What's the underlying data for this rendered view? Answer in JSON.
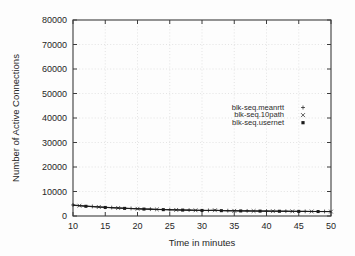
{
  "chart_data": {
    "type": "line",
    "title": "",
    "xlabel": "Time in minutes",
    "ylabel": "Number of Active Connections",
    "xlim": [
      10,
      50
    ],
    "ylim": [
      0,
      80000
    ],
    "grid": true,
    "legend_position": "center-right",
    "xticks": [
      "10",
      "15",
      "20",
      "25",
      "30",
      "35",
      "40",
      "45",
      "50"
    ],
    "xtick_values": [
      10,
      15,
      20,
      25,
      30,
      35,
      40,
      45,
      50
    ],
    "yticks": [
      "0",
      "10000",
      "20000",
      "30000",
      "40000",
      "50000",
      "60000",
      "70000",
      "80000"
    ],
    "ytick_values": [
      0,
      10000,
      20000,
      30000,
      40000,
      50000,
      60000,
      70000,
      80000
    ],
    "x": [
      10,
      11,
      12,
      13,
      14,
      15,
      16,
      17,
      18,
      19,
      20,
      21,
      22,
      23,
      24,
      25,
      26,
      27,
      28,
      29,
      30,
      31,
      32,
      33,
      34,
      35,
      36,
      37,
      38,
      39,
      40,
      41,
      42,
      43,
      44,
      45,
      46,
      47,
      48,
      49,
      50
    ],
    "series": [
      {
        "name": "blk-seq.meanrtt",
        "marker": "plus",
        "marker_glyph": "+",
        "values": [
          4500,
          4280,
          4080,
          3900,
          3740,
          3580,
          3440,
          3310,
          3190,
          3080,
          2980,
          2880,
          2800,
          2720,
          2650,
          2580,
          2520,
          2460,
          2410,
          2360,
          2320,
          2280,
          2400,
          2220,
          2180,
          2150,
          2120,
          2090,
          2060,
          2040,
          2010,
          1990,
          1970,
          1950,
          1930,
          1910,
          1890,
          1870,
          1850,
          1840,
          1820
        ]
      },
      {
        "name": "blk-seq.10path",
        "marker": "cross",
        "marker_glyph": "×",
        "values": [
          4420,
          4210,
          4010,
          3840,
          3680,
          3530,
          3390,
          3270,
          3150,
          3040,
          2940,
          2850,
          2770,
          2690,
          2620,
          2550,
          2490,
          2430,
          2380,
          2330,
          2290,
          2250,
          2340,
          2190,
          2150,
          2120,
          2090,
          2060,
          2030,
          2010,
          1985,
          1965,
          1945,
          1925,
          1905,
          1885,
          1865,
          1850,
          1830,
          1815,
          1800
        ]
      },
      {
        "name": "blk-seq.usernet",
        "marker": "square",
        "marker_glyph": "▪",
        "values": [
          4360,
          4150,
          3960,
          3790,
          3630,
          3490,
          3350,
          3230,
          3110,
          3010,
          2910,
          2820,
          2740,
          2665,
          2595,
          2530,
          2470,
          2415,
          2360,
          2315,
          2270,
          2235,
          2300,
          2175,
          2135,
          2100,
          2070,
          2045,
          2015,
          1995,
          1970,
          1950,
          1930,
          1910,
          1890,
          1875,
          1855,
          1840,
          1820,
          1805,
          1790
        ]
      }
    ]
  }
}
